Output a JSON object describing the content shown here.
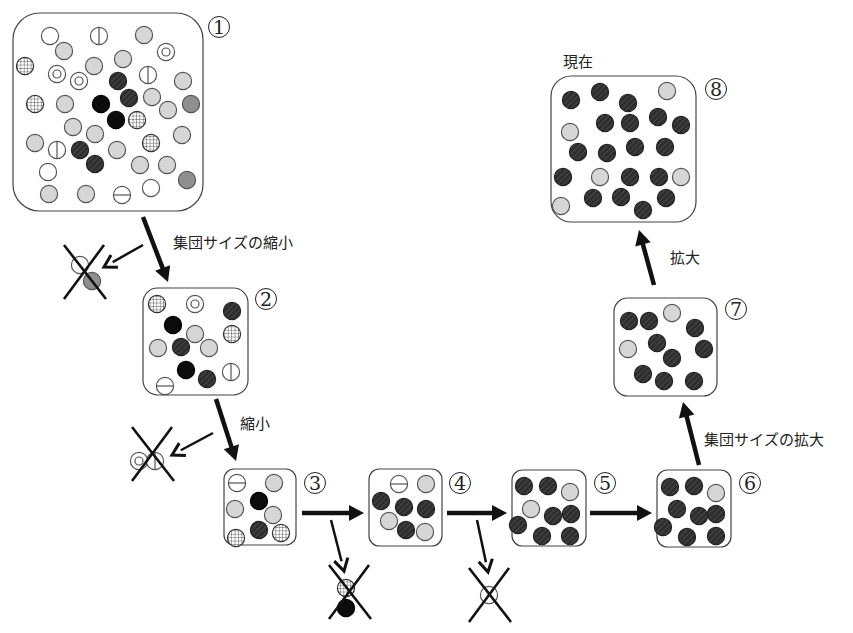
{
  "labels": {
    "shrink_population": "集団サイズの縮小",
    "shrink": "縮小",
    "expand_population": "集団サイズの拡大",
    "expand": "拡大",
    "present": "現在"
  },
  "colors": {
    "stroke": "#555555",
    "light_gray": "#d6d6d6",
    "mid_gray": "#8f8f8f",
    "black": "#0c0c0c",
    "hatched": "#2e2e2e",
    "arrow": "#111111"
  },
  "legend_types": [
    "white",
    "light",
    "double",
    "vbar",
    "hbar",
    "grid",
    "black",
    "hatched",
    "mid"
  ],
  "stages": [
    {
      "id": 1,
      "number": "1",
      "box": [
        13,
        13,
        190,
        198
      ],
      "num_pos": [
        208,
        16
      ],
      "circles": [
        [
          50,
          36,
          "white"
        ],
        [
          99,
          36,
          "vbar"
        ],
        [
          144,
          35,
          "light"
        ],
        [
          64,
          51,
          "light"
        ],
        [
          166,
          52,
          "double"
        ],
        [
          123,
          59,
          "light"
        ],
        [
          25,
          66,
          "grid"
        ],
        [
          57,
          74,
          "double"
        ],
        [
          94,
          66,
          "light"
        ],
        [
          79,
          81,
          "double"
        ],
        [
          118,
          81,
          "hatched"
        ],
        [
          148,
          75,
          "vbar"
        ],
        [
          183,
          81,
          "light"
        ],
        [
          35,
          104,
          "grid"
        ],
        [
          65,
          104,
          "light"
        ],
        [
          101,
          104,
          "black"
        ],
        [
          129,
          98,
          "hatched"
        ],
        [
          152,
          97,
          "light"
        ],
        [
          168,
          110,
          "light"
        ],
        [
          191,
          104,
          "mid"
        ],
        [
          116,
          120,
          "black"
        ],
        [
          137,
          120,
          "grid"
        ],
        [
          73,
          127,
          "light"
        ],
        [
          95,
          134,
          "light"
        ],
        [
          182,
          135,
          "light"
        ],
        [
          35,
          143,
          "light"
        ],
        [
          57,
          150,
          "vbar"
        ],
        [
          80,
          150,
          "hatched"
        ],
        [
          117,
          150,
          "light"
        ],
        [
          151,
          143,
          "grid"
        ],
        [
          95,
          164,
          "hatched"
        ],
        [
          140,
          165,
          "light"
        ],
        [
          167,
          165,
          "light"
        ],
        [
          48,
          172,
          "white"
        ],
        [
          187,
          180,
          "mid"
        ],
        [
          49,
          194,
          "light"
        ],
        [
          86,
          194,
          "light"
        ],
        [
          122,
          195,
          "hbar"
        ],
        [
          151,
          188,
          "white"
        ]
      ]
    },
    {
      "id": 2,
      "number": "2",
      "box": [
        143,
        288,
        105,
        107
      ],
      "num_pos": [
        255,
        288
      ],
      "circles": [
        [
          157,
          304,
          "grid"
        ],
        [
          195,
          304,
          "double"
        ],
        [
          232,
          311,
          "hatched"
        ],
        [
          173,
          325,
          "black"
        ],
        [
          195,
          334,
          "light"
        ],
        [
          232,
          334,
          "grid"
        ],
        [
          158,
          348,
          "light"
        ],
        [
          181,
          347,
          "hatched"
        ],
        [
          209,
          348,
          "light"
        ],
        [
          186,
          370,
          "black"
        ],
        [
          207,
          379,
          "hatched"
        ],
        [
          231,
          372,
          "vbar"
        ],
        [
          165,
          386,
          "hbar"
        ]
      ]
    },
    {
      "id": 3,
      "number": "3",
      "box": [
        224,
        469,
        72,
        76
      ],
      "num_pos": [
        304,
        472
      ],
      "circles": [
        [
          237,
          483,
          "hbar"
        ],
        [
          274,
          483,
          "light"
        ],
        [
          259,
          501,
          "black"
        ],
        [
          235,
          509,
          "light"
        ],
        [
          273,
          515,
          "light"
        ],
        [
          259,
          530,
          "hatched"
        ],
        [
          281,
          533,
          "grid"
        ],
        [
          236,
          538,
          "grid"
        ]
      ]
    },
    {
      "id": 4,
      "number": "4",
      "box": [
        369,
        469,
        73,
        77
      ],
      "num_pos": [
        449,
        472
      ],
      "circles": [
        [
          399,
          484,
          "hbar"
        ],
        [
          426,
          484,
          "light"
        ],
        [
          381,
          501,
          "hatched"
        ],
        [
          404,
          507,
          "hatched"
        ],
        [
          426,
          509,
          "hatched"
        ],
        [
          389,
          521,
          "light"
        ],
        [
          406,
          530,
          "hatched"
        ],
        [
          425,
          532,
          "light"
        ]
      ]
    },
    {
      "id": 5,
      "number": "5",
      "box": [
        512,
        470,
        74,
        76
      ],
      "num_pos": [
        594,
        472
      ],
      "circles": [
        [
          524,
          486,
          "hatched"
        ],
        [
          548,
          486,
          "hatched"
        ],
        [
          570,
          492,
          "light"
        ],
        [
          531,
          509,
          "light"
        ],
        [
          553,
          516,
          "hatched"
        ],
        [
          571,
          514,
          "hatched"
        ],
        [
          518,
          525,
          "hatched"
        ],
        [
          542,
          536,
          "hatched"
        ],
        [
          570,
          536,
          "hatched"
        ]
      ]
    },
    {
      "id": 6,
      "number": "6",
      "box": [
        657,
        470,
        74,
        77
      ],
      "num_pos": [
        739,
        472
      ],
      "circles": [
        [
          670,
          487,
          "hatched"
        ],
        [
          694,
          486,
          "hatched"
        ],
        [
          716,
          493,
          "light"
        ],
        [
          677,
          509,
          "hatched"
        ],
        [
          699,
          516,
          "hatched"
        ],
        [
          716,
          514,
          "hatched"
        ],
        [
          663,
          527,
          "hatched"
        ],
        [
          687,
          537,
          "hatched"
        ],
        [
          716,
          536,
          "hatched"
        ]
      ]
    },
    {
      "id": 7,
      "number": "7",
      "box": [
        614,
        298,
        103,
        98
      ],
      "num_pos": [
        725,
        298
      ],
      "circles": [
        [
          629,
          321,
          "hatched"
        ],
        [
          649,
          321,
          "hatched"
        ],
        [
          672,
          313,
          "light"
        ],
        [
          695,
          328,
          "hatched"
        ],
        [
          628,
          349,
          "light"
        ],
        [
          657,
          343,
          "hatched"
        ],
        [
          704,
          349,
          "hatched"
        ],
        [
          672,
          358,
          "hatched"
        ],
        [
          643,
          374,
          "hatched"
        ],
        [
          664,
          381,
          "hatched"
        ],
        [
          694,
          381,
          "hatched"
        ]
      ]
    },
    {
      "id": 8,
      "number": "8",
      "box": [
        551,
        76,
        145,
        146
      ],
      "num_pos": [
        705,
        78
      ],
      "circles": [
        [
          571,
          100,
          "hatched"
        ],
        [
          600,
          92,
          "hatched"
        ],
        [
          628,
          103,
          "hatched"
        ],
        [
          667,
          91,
          "light"
        ],
        [
          570,
          132,
          "light"
        ],
        [
          605,
          123,
          "hatched"
        ],
        [
          630,
          123,
          "hatched"
        ],
        [
          658,
          117,
          "hatched"
        ],
        [
          681,
          125,
          "hatched"
        ],
        [
          578,
          152,
          "hatched"
        ],
        [
          607,
          153,
          "hatched"
        ],
        [
          635,
          147,
          "hatched"
        ],
        [
          665,
          147,
          "hatched"
        ],
        [
          563,
          177,
          "hatched"
        ],
        [
          600,
          177,
          "light"
        ],
        [
          630,
          177,
          "hatched"
        ],
        [
          659,
          177,
          "hatched"
        ],
        [
          681,
          177,
          "light"
        ],
        [
          561,
          206,
          "light"
        ],
        [
          593,
          198,
          "hatched"
        ],
        [
          621,
          197,
          "hatched"
        ],
        [
          643,
          210,
          "hatched"
        ],
        [
          666,
          198,
          "hatched"
        ]
      ]
    }
  ],
  "removed": [
    {
      "cross_center": [
        84,
        272
      ],
      "circles": [
        [
          80,
          265,
          "white"
        ],
        [
          92,
          281,
          "mid"
        ]
      ]
    },
    {
      "cross_center": [
        152,
        454
      ],
      "circles": [
        [
          139,
          461,
          "double"
        ],
        [
          155,
          461,
          "vbar"
        ]
      ]
    },
    {
      "cross_center": [
        349,
        592
      ],
      "circles": [
        [
          346,
          588,
          "grid"
        ],
        [
          346,
          608,
          "black"
        ]
      ]
    },
    {
      "cross_center": [
        489,
        595
      ],
      "circles": [
        [
          489,
          595,
          "white"
        ]
      ]
    }
  ],
  "arrows": [
    {
      "from": [
        143,
        217
      ],
      "to": [
        168,
        282
      ],
      "width": 4.5,
      "label": "shrink_population"
    },
    {
      "from": [
        143,
        245
      ],
      "to": [
        104,
        267
      ],
      "width": 2.5
    },
    {
      "from": [
        216,
        399
      ],
      "to": [
        236,
        461
      ],
      "width": 4.5,
      "label": "shrink"
    },
    {
      "from": [
        213,
        433
      ],
      "to": [
        172,
        455
      ],
      "width": 2.5
    },
    {
      "from": [
        302,
        513
      ],
      "to": [
        364,
        513
      ],
      "width": 4.5
    },
    {
      "from": [
        331,
        520
      ],
      "to": [
        344,
        571
      ],
      "width": 2.5
    },
    {
      "from": [
        447,
        513
      ],
      "to": [
        507,
        513
      ],
      "width": 4.5
    },
    {
      "from": [
        477,
        520
      ],
      "to": [
        488,
        572
      ],
      "width": 2.5
    },
    {
      "from": [
        590,
        513
      ],
      "to": [
        652,
        513
      ],
      "width": 4.5
    },
    {
      "from": [
        699,
        465
      ],
      "to": [
        683,
        402
      ],
      "width": 4.5,
      "label": "expand_population"
    },
    {
      "from": [
        654,
        285
      ],
      "to": [
        639,
        230
      ],
      "width": 4.5,
      "label": "expand"
    }
  ],
  "label_positions": {
    "shrink_population": [
      173,
      231
    ],
    "shrink": [
      240,
      412
    ],
    "expand_population": [
      704,
      428
    ],
    "expand": [
      670,
      246
    ],
    "present": [
      563,
      50
    ]
  }
}
